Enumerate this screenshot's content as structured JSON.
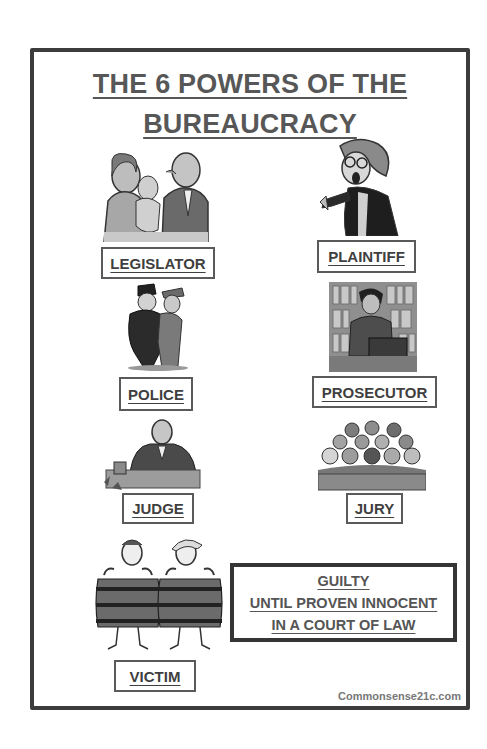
{
  "poster": {
    "title_line1": "THE 6 POWERS OF THE",
    "title_line2": "BUREAUCRACY",
    "roles": [
      {
        "label": "LEGISLATOR",
        "illustration": "politician-holding-baby-icon"
      },
      {
        "label": "PLAINTIFF",
        "illustration": "shouting-woman-icon"
      },
      {
        "label": "POLICE",
        "illustration": "police-officer-arresting-man-icon"
      },
      {
        "label": "PROSECUTOR",
        "illustration": "lawyer-with-briefcase-icon"
      },
      {
        "label": "JUDGE",
        "illustration": "judge-at-bench-icon"
      },
      {
        "label": "JURY",
        "illustration": "jury-crowd-icon"
      },
      {
        "label": "VICTIM",
        "illustration": "people-in-barrels-icon"
      }
    ],
    "slogan": {
      "line1": "GUILTY",
      "line2": "UNTIL PROVEN INNOCENT",
      "line3": "IN A COURT OF LAW"
    },
    "watermark": "Commonsense21c.com"
  }
}
